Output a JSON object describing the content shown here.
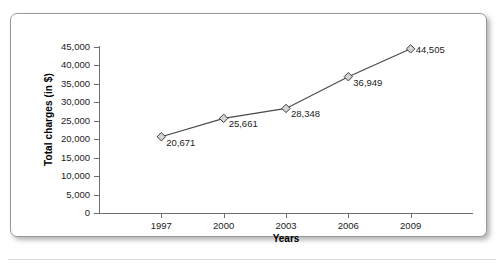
{
  "chart_data": {
    "type": "line",
    "title": "",
    "xlabel": "Years",
    "ylabel": "Total charges (in $)",
    "categories": [
      "1997",
      "2000",
      "2003",
      "2006",
      "2009"
    ],
    "values": [
      20671,
      25661,
      28348,
      36949,
      44505
    ],
    "data_labels": [
      "20,671",
      "25,661",
      "28,348",
      "36,949",
      "44,505"
    ],
    "series": [
      {
        "name": "Total charges",
        "values": [
          20671,
          25661,
          28348,
          36949,
          44505
        ]
      }
    ],
    "ylim": [
      0,
      45000
    ],
    "ytick_step": 5000,
    "ytick_labels": [
      "45,000",
      "40,000",
      "35,000",
      "30,000",
      "25,000",
      "20,000",
      "15,000",
      "10,000",
      "5,000",
      "0"
    ],
    "ytick_values": [
      45000,
      40000,
      35000,
      30000,
      25000,
      20000,
      15000,
      10000,
      5000,
      0
    ],
    "grid": false,
    "legend": false,
    "marker": "diamond",
    "line_color": "#4a4a4a",
    "marker_fill": "#d5d5d5",
    "marker_stroke": "#3c3c3c",
    "axis_color": "#6d6d6d",
    "text_color": "#1b1b1b"
  }
}
